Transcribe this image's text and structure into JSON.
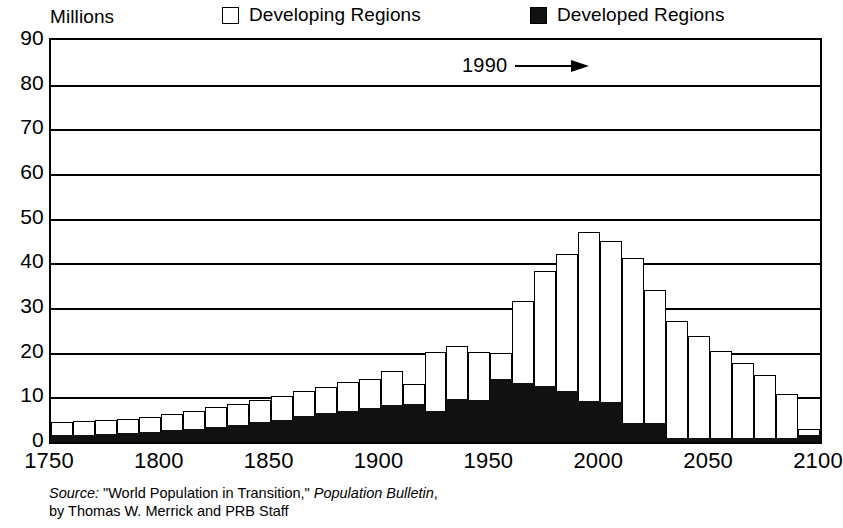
{
  "header": {
    "units_label": "Millions",
    "legend": [
      {
        "key": "developing",
        "label": "Developing Regions",
        "swatch": "open-square-icon",
        "color": "#ffffff"
      },
      {
        "key": "developed",
        "label": "Developed Regions",
        "swatch": "filled-square-icon",
        "color": "#111111"
      }
    ]
  },
  "annotation": {
    "label": "1990",
    "arrow": "right-arrow-icon",
    "points_to_year": 1990
  },
  "source_note": {
    "prefix": "Source:",
    "line1_rest": " \"World Population in Transition,\" ",
    "publication": "Population Bulletin",
    "line1_tail": ",",
    "line2": "by Thomas W. Merrick and PRB Staff"
  },
  "chart_data": {
    "type": "bar",
    "subtype": "stacked-vertical",
    "title": "",
    "subtitle": "",
    "xlabel": "",
    "ylabel": "Millions",
    "ylim": [
      0,
      90
    ],
    "xlim": [
      1750,
      2100
    ],
    "grid": true,
    "grid_axis": "y",
    "legend_position": "top",
    "y_ticks": [
      0,
      10,
      20,
      30,
      40,
      50,
      60,
      70,
      80,
      90
    ],
    "x_ticks": [
      1750,
      1800,
      1850,
      1900,
      1950,
      2000,
      2050,
      2100
    ],
    "bar_interval_years": 10,
    "categories": [
      1750,
      1760,
      1770,
      1780,
      1790,
      1800,
      1810,
      1820,
      1830,
      1840,
      1850,
      1860,
      1870,
      1880,
      1890,
      1900,
      1910,
      1920,
      1930,
      1940,
      1950,
      1960,
      1970,
      1980,
      1990,
      2000,
      2010,
      2020,
      2030,
      2040,
      2050,
      2060,
      2070,
      2080,
      2090
    ],
    "series": [
      {
        "name": "Developed Regions",
        "color": "#111111",
        "values": [
          1.5,
          1.6,
          1.8,
          2.0,
          2.2,
          2.6,
          3.0,
          3.4,
          3.8,
          4.4,
          5.0,
          5.8,
          6.4,
          7.0,
          7.6,
          8.2,
          8.6,
          7.0,
          9.6,
          9.4,
          14.0,
          13.2,
          12.6,
          11.4,
          9.2,
          9.0,
          4.2,
          4.2,
          1.0,
          1.0,
          1.0,
          1.0,
          0.9,
          0.8,
          1.6
        ]
      },
      {
        "name": "Developing Regions",
        "color": "#ffffff",
        "values": [
          3.0,
          3.1,
          3.2,
          3.2,
          3.3,
          3.6,
          4.0,
          4.4,
          4.8,
          5.0,
          5.4,
          5.6,
          6.0,
          6.4,
          6.6,
          7.6,
          4.4,
          13.2,
          11.8,
          10.8,
          6.0,
          18.4,
          25.6,
          30.6,
          37.8,
          36.0,
          37.0,
          29.8,
          26.2,
          22.8,
          19.4,
          16.8,
          14.2,
          10.0,
          1.4
        ]
      }
    ],
    "totals": [
      4.5,
      4.7,
      5.0,
      5.2,
      5.5,
      6.2,
      7.0,
      7.8,
      8.6,
      9.4,
      10.4,
      11.4,
      12.4,
      13.4,
      14.2,
      15.8,
      13.0,
      20.2,
      21.4,
      20.2,
      20.0,
      31.6,
      38.2,
      42.0,
      47.0,
      45.0,
      41.2,
      34.0,
      27.2,
      23.8,
      20.4,
      17.8,
      15.1,
      10.8,
      3.0
    ],
    "bar_tops_readable": {
      "1950": 20.0,
      "1960": 31.6,
      "1970": 38.2,
      "1980": 42.0,
      "1990": 47.0,
      "2000": 45.0,
      "2010": 41.2,
      "2020": 34.0,
      "2030": 27.2,
      "2040": 23.8,
      "2050": 20.4,
      "2060": 17.8,
      "2070": 15.1,
      "2080": 10.8,
      "2090": 3.0
    }
  }
}
